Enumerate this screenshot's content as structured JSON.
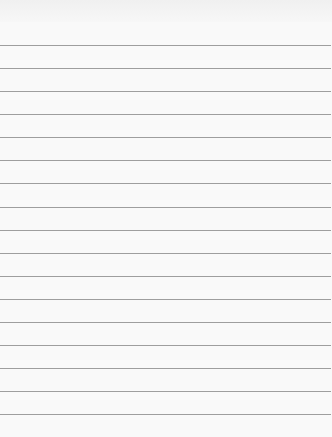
{
  "page": {
    "header_text": "",
    "background": "#f9f9f9",
    "rule_color": "#9e9e9e",
    "rule_count": 17,
    "rules_y": [
      45,
      68,
      91,
      114,
      137,
      160,
      183,
      207,
      230,
      253,
      276,
      299,
      322,
      345,
      368,
      391,
      414
    ]
  }
}
